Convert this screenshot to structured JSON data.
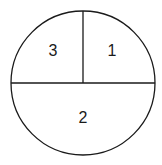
{
  "diagram": {
    "type": "divided-circle",
    "stroke_color": "#1a1a1a",
    "background": "#ffffff",
    "circle": {
      "cx": 83,
      "cy": 83,
      "r": 72
    },
    "regions": [
      {
        "id": "top-left",
        "label": "3"
      },
      {
        "id": "top-right",
        "label": "1"
      },
      {
        "id": "bottom",
        "label": "2"
      }
    ]
  }
}
